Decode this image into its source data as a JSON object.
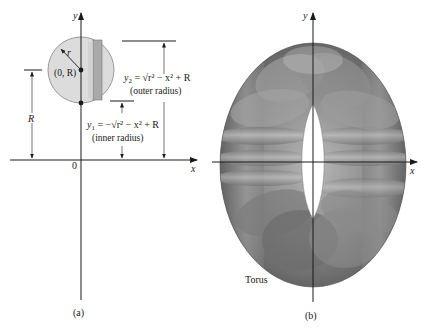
{
  "figure": {
    "panel_a": {
      "caption": "(a)",
      "axis_x_label": "x",
      "axis_y_label": "y",
      "origin_label": "0",
      "center_label": "(0, R)",
      "radius_label": "r",
      "height_label": "R",
      "outer": {
        "y_label": "y",
        "y_sub": "2",
        "equation_rhs": " = √r² − x² + R",
        "description": "(outer radius)"
      },
      "inner": {
        "y_label": "y",
        "y_sub": "1",
        "equation_rhs": " = −√r² − x² + R",
        "description": "(inner radius)"
      },
      "colors": {
        "disk_fill": "#d9d9d9",
        "disk_stroke": "#9a9a9a",
        "strip_fill": "#a8a8a8",
        "strip_light": "#c9c9c9",
        "axis": "#1a1a1a"
      }
    },
    "panel_b": {
      "caption": "(b)",
      "axis_x_label": "x",
      "axis_y_label": "y",
      "solid_label": "Torus",
      "colors": {
        "torus_dark": "#5f5f5f",
        "torus_mid": "#8a8a8a",
        "torus_light": "#b8b8b8",
        "axis": "#1a1a1a"
      }
    }
  }
}
